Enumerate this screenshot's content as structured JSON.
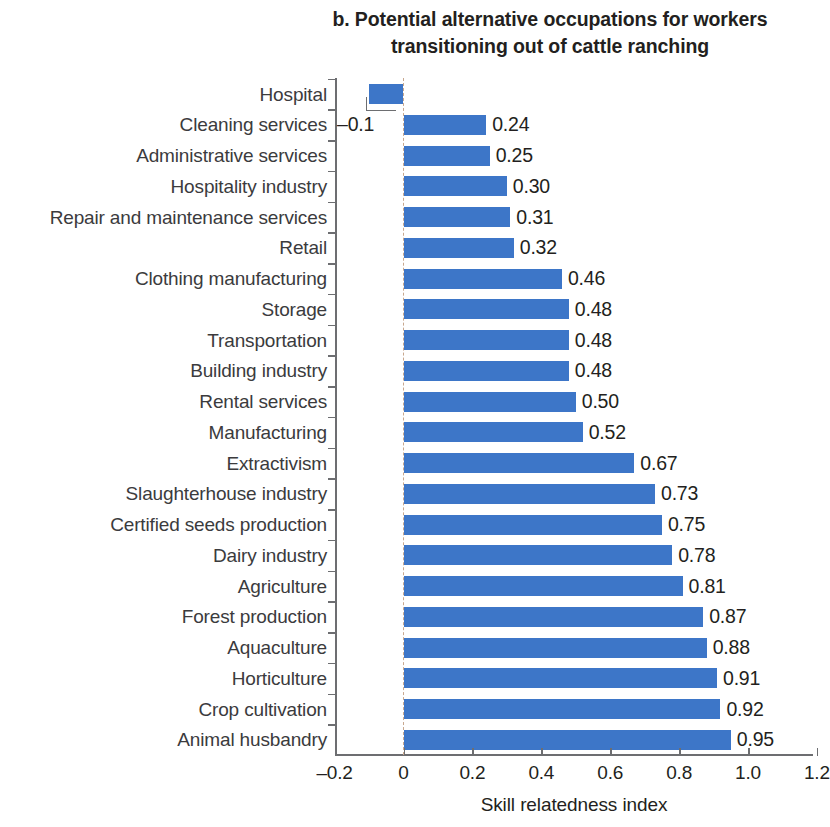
{
  "chart_data": {
    "type": "bar",
    "orientation": "horizontal",
    "title_line1": "b. Potential alternative occupations for workers",
    "title_line2": "transitioning out of cattle ranching",
    "xlabel": "Skill relatedness index",
    "ylabel": "",
    "xlim": [
      -0.2,
      1.2
    ],
    "xticks": [
      -0.2,
      0,
      0.2,
      0.4,
      0.6,
      0.8,
      1.0,
      1.2
    ],
    "xticklabels": [
      "-0.2",
      "0",
      "0.2",
      "0.4",
      "0.6",
      "0.8",
      "1.0",
      "1.2"
    ],
    "grid": false,
    "legend": false,
    "zero_reference_line": true,
    "bar_color": "#3d76c8",
    "categories": [
      "Hospital",
      "Cleaning services",
      "Administrative services",
      "Hospitality industry",
      "Repair and maintenance services",
      "Retail",
      "Clothing manufacturing",
      "Storage",
      "Transportation",
      "Building industry",
      "Rental services",
      "Manufacturing",
      "Extractivism",
      "Slaughterhouse industry",
      "Certified seeds production",
      "Dairy industry",
      "Agriculture",
      "Forest production",
      "Aquaculture",
      "Horticulture",
      "Crop cultivation",
      "Animal husbandry"
    ],
    "values": [
      -0.1,
      0.24,
      0.25,
      0.3,
      0.31,
      0.32,
      0.46,
      0.48,
      0.48,
      0.48,
      0.5,
      0.52,
      0.67,
      0.73,
      0.75,
      0.78,
      0.81,
      0.87,
      0.88,
      0.91,
      0.92,
      0.95
    ],
    "value_labels": [
      "-0.1",
      "0.24",
      "0.25",
      "0.30",
      "0.31",
      "0.32",
      "0.46",
      "0.48",
      "0.48",
      "0.48",
      "0.50",
      "0.52",
      "0.67",
      "0.73",
      "0.75",
      "0.78",
      "0.81",
      "0.87",
      "0.88",
      "0.91",
      "0.92",
      "0.95"
    ]
  }
}
